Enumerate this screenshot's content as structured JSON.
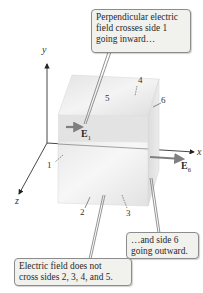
{
  "figure": {
    "axes": {
      "x_label": "x",
      "y_label": "y",
      "z_label": "z"
    },
    "faces": {
      "side1": "1",
      "side2": "2",
      "side3": "3",
      "side4": "4",
      "side5": "5",
      "side6": "6"
    },
    "vectors": {
      "e1": {
        "symbol": "E",
        "subscript": "1"
      },
      "e6": {
        "symbol": "E",
        "subscript": "6"
      }
    },
    "callouts": {
      "top": [
        "Perpendicular electric",
        "field crosses side 1",
        "going inward…"
      ],
      "right": [
        "…and side 6",
        "going outward."
      ],
      "bottom": [
        "Electric field does not",
        "cross sides 2, 3, 4, and 5."
      ]
    },
    "colors": {
      "arrow": "#8a8a8a",
      "axis": "#333333",
      "callout_bg": "#f1f1ee",
      "callout_border": "#8c8c8c"
    }
  }
}
